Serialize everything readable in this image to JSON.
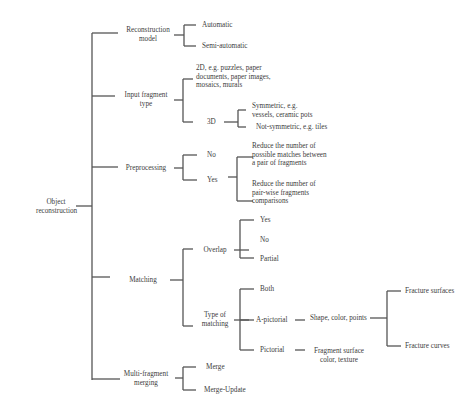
{
  "diagram": {
    "root": "Object\nreconstruction",
    "reconstruction_model": {
      "label": "Reconstruction\nmodel",
      "children": [
        "Automatic",
        "Semi-automatic"
      ]
    },
    "input_fragment_type": {
      "label": "Input fragment\ntype",
      "two_d": "2D, e.g. puzzles, paper\ndocuments, paper images,\nmosaics, murals",
      "three_d": {
        "label": "3D",
        "children": [
          "Symmetric, e.g.\nvessels, ceramic pots",
          "Not-symmetric, e.g. tiles"
        ]
      }
    },
    "preprocessing": {
      "label": "Preprocessing",
      "no": "No",
      "yes": "Yes",
      "children": [
        "Reduce the number of\npossible matches between\na pair of fragments",
        "Reduce the number of\npair-wise fragments\ncomparisons"
      ]
    },
    "matching": {
      "label": "Matching",
      "overlap": {
        "label": "Overlap",
        "children": [
          "Yes",
          "No",
          "Partial"
        ]
      },
      "type_of_matching": {
        "label": "Type of\nmatching",
        "both": "Both",
        "a_pictorial": {
          "label": "A-pictorial",
          "feature": "Shape, color, points",
          "children": [
            "Fracture surfaces",
            "Fracture curves"
          ]
        },
        "pictorial": {
          "label": "Pictorial",
          "feature": "Fragment surface\ncolor, texture"
        }
      }
    },
    "multi_fragment_merging": {
      "label": "Multi-fragment\nmerging",
      "children": [
        "Merge",
        "Merge-Update"
      ]
    }
  }
}
